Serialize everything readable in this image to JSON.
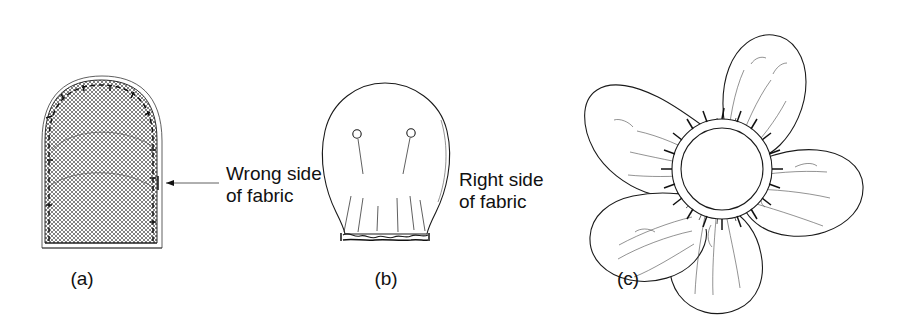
{
  "figure": {
    "kind": "line-art instructional diagram",
    "background_color": "#ffffff",
    "ink_color": "#111111",
    "panels": [
      {
        "id": "a",
        "caption": "(a)",
        "shape": "domed fabric piece",
        "fill": "cross-hatch fabric weave texture",
        "edge_treatment": "running stitch along curved edge",
        "annotation": {
          "line1": "Wrong side",
          "line2": "of fabric",
          "leader": "arrow pointing left to fabric edge"
        }
      },
      {
        "id": "b",
        "caption": "(b)",
        "shape": "petal turned right side out",
        "details": "two straight pins with round heads, gathering lines at base, gathered wavy lower edge",
        "annotation": {
          "line1": "Right side",
          "line2": "of fabric",
          "leader": "none"
        }
      },
      {
        "id": "c",
        "caption": "(c)",
        "shape": "assembled five-petal flower",
        "details": "five gathered petals stitched around a central circle with overcast stitches",
        "petal_count": 5
      }
    ],
    "labels": {
      "wrong_side_line1": "Wrong side",
      "wrong_side_line2": "of fabric",
      "right_side_line1": "Right side",
      "right_side_line2": "of fabric",
      "caption_a": "(a)",
      "caption_b": "(b)",
      "caption_c": "(c)"
    }
  }
}
